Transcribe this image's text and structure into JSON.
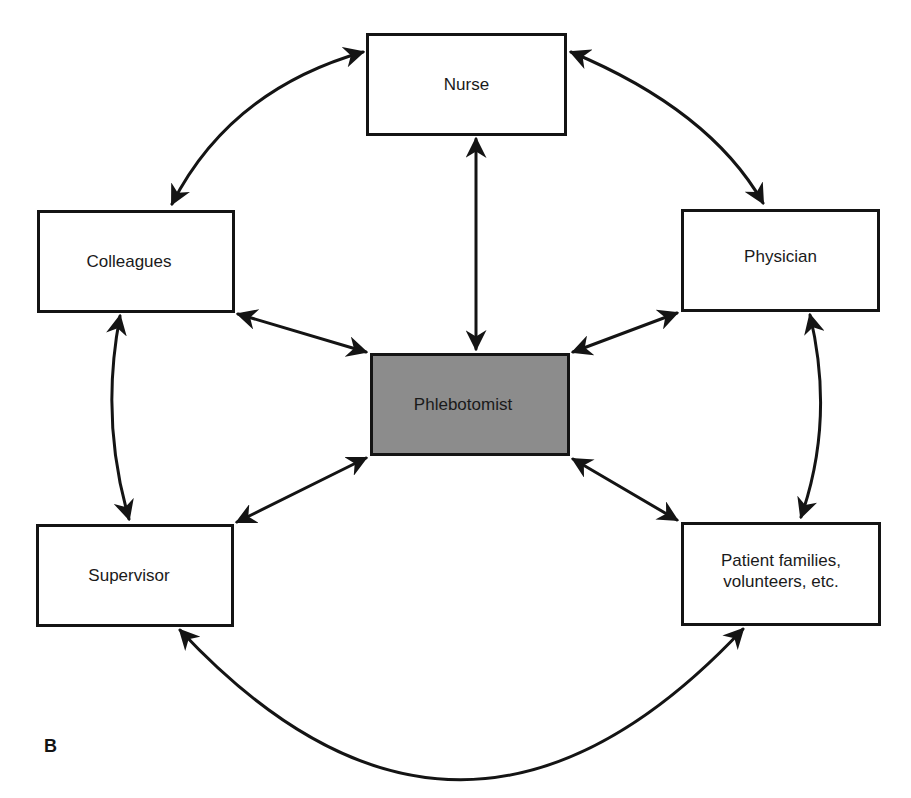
{
  "figure": {
    "label": "B",
    "colors": {
      "stroke": "#141414",
      "node_fill": "#ffffff",
      "center_fill": "#8c8c8c",
      "background": "#ffffff"
    }
  },
  "nodes": {
    "nurse": {
      "label": "Nurse"
    },
    "colleagues": {
      "label": "Colleagues"
    },
    "physician": {
      "label": "Physician"
    },
    "phlebotomist": {
      "label": "Phlebotomist"
    },
    "supervisor": {
      "label": "Supervisor"
    },
    "patient_families": {
      "label": "Patient families,\nvolunteers, etc."
    }
  },
  "edges": [
    {
      "from": "Nurse",
      "to": "Phlebotomist",
      "direction": "bidirectional"
    },
    {
      "from": "Colleagues",
      "to": "Phlebotomist",
      "direction": "bidirectional"
    },
    {
      "from": "Physician",
      "to": "Phlebotomist",
      "direction": "bidirectional"
    },
    {
      "from": "Supervisor",
      "to": "Phlebotomist",
      "direction": "bidirectional"
    },
    {
      "from": "Patient families, volunteers, etc.",
      "to": "Phlebotomist",
      "direction": "bidirectional"
    },
    {
      "from": "Nurse",
      "to": "Colleagues",
      "direction": "bidirectional"
    },
    {
      "from": "Nurse",
      "to": "Physician",
      "direction": "bidirectional"
    },
    {
      "from": "Colleagues",
      "to": "Supervisor",
      "direction": "bidirectional"
    },
    {
      "from": "Physician",
      "to": "Patient families, volunteers, etc.",
      "direction": "bidirectional"
    },
    {
      "from": "Supervisor",
      "to": "Patient families, volunteers, etc.",
      "direction": "bidirectional"
    }
  ]
}
